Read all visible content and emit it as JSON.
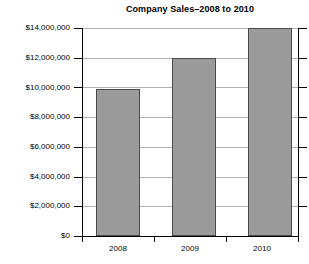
{
  "chart_data": {
    "type": "bar",
    "title": "Company Sales–2008 to 2010",
    "xlabel": "",
    "ylabel": "",
    "categories": [
      "2008",
      "2009",
      "2010"
    ],
    "values": [
      9900000,
      12000000,
      14000000
    ],
    "series": [
      {
        "name": "Company Sales",
        "values": [
          9900000,
          12000000,
          14000000
        ]
      }
    ],
    "ylim": [
      0,
      14000000
    ],
    "ytick_values": [
      0,
      2000000,
      4000000,
      6000000,
      8000000,
      10000000,
      12000000,
      14000000
    ],
    "ytick_labels": [
      "$0",
      "$2,000,000",
      "$4,000,000",
      "$6,000,000",
      "$8,000,000",
      "$10,000,000",
      "$12,000,000",
      "$14,000,000"
    ],
    "grid": true,
    "legend": false,
    "bar_color": "#9b9b9b",
    "bar_border_color": "#4a4a4a",
    "gridline_color": "#b0b0b0",
    "axis_color": "#000000",
    "background_color": "#ffffff"
  }
}
